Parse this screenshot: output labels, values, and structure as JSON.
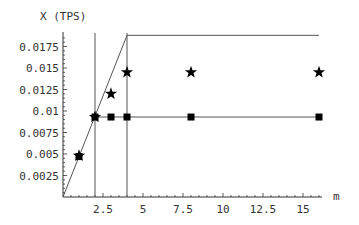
{
  "chart_data": {
    "type": "scatter",
    "title": "",
    "xlabel": "m",
    "ylabel": "X (TPS)",
    "xlim": [
      0,
      17
    ],
    "ylim": [
      0,
      0.019
    ],
    "grid": false,
    "legend": null,
    "x_ticks": [
      2.5,
      5,
      7.5,
      10,
      12.5,
      15
    ],
    "x_tick_labels": [
      "2.5",
      "5",
      "7.5",
      "10",
      "12.5",
      "15"
    ],
    "y_ticks": [
      0.0025,
      0.005,
      0.0075,
      0.01,
      0.0125,
      0.015,
      0.0175
    ],
    "y_tick_labels": [
      "0.0025",
      "0.005",
      "0.0075",
      "0.01",
      "0.0125",
      "0.015",
      "0.0175"
    ],
    "series": [
      {
        "name": "stars",
        "marker": "star",
        "x": [
          1,
          2,
          3,
          4,
          8,
          16
        ],
        "values": [
          0.0048,
          0.0093,
          0.012,
          0.0145,
          0.0145,
          0.0145
        ]
      },
      {
        "name": "squares",
        "marker": "square",
        "x": [
          1,
          2,
          3,
          4,
          8,
          16
        ],
        "values": [
          0.0047,
          0.0093,
          0.0093,
          0.0093,
          0.0093,
          0.0093
        ]
      },
      {
        "name": "upper-bound",
        "marker": "line",
        "x": [
          0,
          4,
          16
        ],
        "values": [
          0,
          0.0188,
          0.0188
        ]
      },
      {
        "name": "square-curve",
        "marker": "line",
        "x": [
          2,
          16
        ],
        "values": [
          0.0093,
          0.0093
        ]
      }
    ],
    "annotations": [
      {
        "type": "vline",
        "x": 2
      },
      {
        "type": "vline",
        "x": 4
      }
    ]
  },
  "labels": {
    "y_axis_title": "X (TPS)",
    "x_axis_title": "m"
  },
  "colors": {
    "axis": "#333333",
    "line": "#555555",
    "marker": "#000000"
  }
}
